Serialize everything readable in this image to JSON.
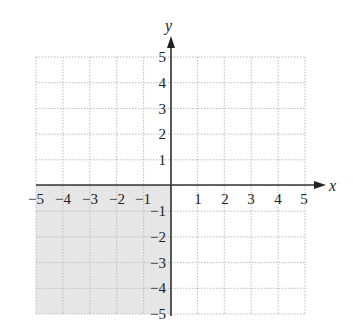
{
  "chart_data": {
    "type": "region",
    "title": "",
    "xlabel": "x",
    "ylabel": "y",
    "xlim": [
      -5,
      5
    ],
    "ylim": [
      -5,
      5
    ],
    "grid": true,
    "x_ticks": [
      "-5",
      "-4",
      "-3",
      "-2",
      "-1",
      "1",
      "2",
      "3",
      "4",
      "5"
    ],
    "y_ticks": [
      "5",
      "4",
      "3",
      "2",
      "1",
      "-1",
      "-2",
      "-3",
      "-4",
      "-5"
    ],
    "shaded_region": {
      "description": "Third quadrant: x < 0 and y < 0",
      "x_range": [
        -5,
        0
      ],
      "y_range": [
        -5,
        0
      ],
      "fill": "#e6e6e6"
    },
    "colors": {
      "grid": "#bdbdbd",
      "axis": "#333333",
      "shade": "#e6e6e6"
    }
  },
  "labels": {
    "x_axis": "x",
    "y_axis": "y",
    "x_neg": [
      "−5",
      "−4",
      "−3",
      "−2",
      "−1"
    ],
    "x_pos": [
      "1",
      "2",
      "3",
      "4",
      "5"
    ],
    "y_pos": [
      "5",
      "4",
      "3",
      "2",
      "1"
    ],
    "y_neg": [
      "−1",
      "−2",
      "−3",
      "−4",
      "−5"
    ]
  }
}
